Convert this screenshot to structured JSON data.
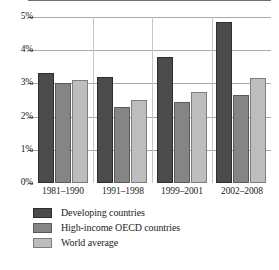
{
  "chart_data": {
    "type": "bar",
    "title": "",
    "xlabel": "",
    "ylabel": "",
    "categories": [
      "1981–1990",
      "1991–1998",
      "1999–2001",
      "2002–2008"
    ],
    "series": [
      {
        "name": "Developing countries",
        "color": "#4b4b4b",
        "values": [
          3.3,
          3.2,
          3.8,
          4.85
        ]
      },
      {
        "name": "High-income OECD countries",
        "color": "#858585",
        "values": [
          3.0,
          2.3,
          2.45,
          2.65
        ]
      },
      {
        "name": "World average",
        "color": "#bdbdbd",
        "values": [
          3.1,
          2.5,
          2.75,
          3.15
        ]
      }
    ],
    "ylim": [
      0,
      5
    ],
    "ytick_values": [
      0,
      1,
      2,
      3,
      4,
      5
    ],
    "ytick_labels": [
      "0%",
      "1%",
      "2%",
      "3%",
      "4%",
      "5%"
    ],
    "grid": true,
    "grid_axis": "y",
    "legend_position": "bottom-left",
    "legend_entries": [
      "Developing countries",
      "High-income OECD countries",
      "World average"
    ]
  }
}
